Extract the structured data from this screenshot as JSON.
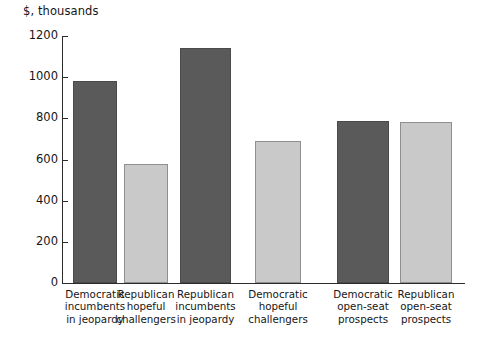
{
  "chart_data": {
    "type": "bar",
    "title": "",
    "subtitle": "",
    "xlabel": "",
    "ylabel": "$, thousands",
    "ylim": [
      0,
      1200
    ],
    "grid": false,
    "legend": "none",
    "yticks": [
      0,
      200,
      400,
      600,
      800,
      1000,
      1200
    ],
    "ytick_labels": [
      "0",
      "200",
      "400",
      "600",
      "800",
      "1000",
      "1200"
    ],
    "categories": [
      "Democratic incumbents in jeopardy",
      "Republican hopeful challengers",
      "Republican incumbents in jeopardy",
      "Democratic hopeful challengers",
      "Democratic open-seat prospects",
      "Republican open-seat prospects"
    ],
    "category_lines": [
      [
        "Democratic",
        "incumbents",
        "in jeopardy"
      ],
      [
        "Republican",
        "hopeful",
        "challengers"
      ],
      [
        "Republican",
        "incumbents",
        "in jeopardy"
      ],
      [
        "Democratic",
        "hopeful",
        "challengers"
      ],
      [
        "Democratic",
        "open-seat",
        "prospects"
      ],
      [
        "Republican",
        "open-seat",
        "prospects"
      ]
    ],
    "values": [
      980,
      578,
      1140,
      688,
      787,
      782
    ],
    "bar_colors": [
      "dark",
      "light",
      "dark",
      "light",
      "dark",
      "light"
    ],
    "colors": {
      "dark_bar": "#5a5a5a",
      "dark_bar_border": "#4a4a4a",
      "light_bar": "#c9c9c9",
      "light_bar_border": "#8f8f8f",
      "axis": "#2b2b2b",
      "text": "#161616",
      "background": "#ffffff"
    }
  }
}
